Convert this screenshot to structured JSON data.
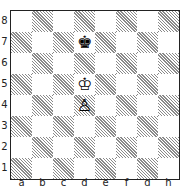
{
  "diagram": {
    "type": "chess-position",
    "ranks": [
      "8",
      "7",
      "6",
      "5",
      "4",
      "3",
      "2",
      "1"
    ],
    "files": [
      "a",
      "b",
      "c",
      "d",
      "e",
      "f",
      "g",
      "h"
    ],
    "pieces": [
      {
        "square": "d7",
        "piece": "king",
        "color": "black",
        "glyph": "♚"
      },
      {
        "square": "d5",
        "piece": "king",
        "color": "white",
        "glyph": "♔"
      },
      {
        "square": "d4",
        "piece": "pawn",
        "color": "white",
        "glyph": "♙"
      }
    ],
    "colors": {
      "dark_square_hatch": "#8a8a8a",
      "light_square": "#ffffff",
      "border": "#222222"
    }
  }
}
